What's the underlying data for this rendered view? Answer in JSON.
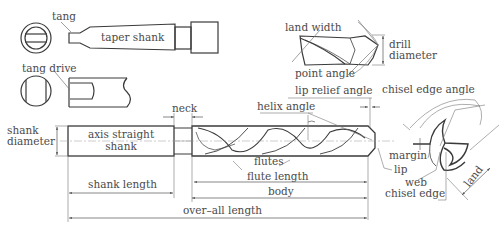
{
  "diagram": {
    "colors": {
      "line": "#3a3a3a",
      "text": "#4a4a4a",
      "thin": "#7a7a7a",
      "background": "#ffffff"
    },
    "views": {
      "taper_shank_view": {
        "labels": {
          "tang": "tang",
          "taper_shank": "taper shank"
        }
      },
      "tang_drive_view": {
        "labels": {
          "tang_drive": "tang drive"
        }
      },
      "point_detail_view": {
        "labels": {
          "land_width": "land width",
          "drill_diameter_line1": "drill",
          "drill_diameter_line2": "diameter",
          "point_angle": "point angle"
        }
      },
      "main_side_view": {
        "labels": {
          "shank_diameter_line1": "shank",
          "shank_diameter_line2": "diameter",
          "axis_straight_line1": "axis straight",
          "axis_straight_line2": "shank",
          "neck": "neck",
          "helix_angle": "helix angle",
          "lip_relief_angle": "lip relief angle",
          "flutes": "flutes",
          "flute_length": "flute length",
          "body": "body",
          "shank_length": "shank length",
          "overall_length": "over–all length"
        }
      },
      "end_view": {
        "labels": {
          "chisel_edge_angle": "chisel edge angle",
          "margin": "margin",
          "lip": "lip",
          "web": "web",
          "chisel_edge": "chisel edge",
          "land": "land"
        }
      }
    }
  }
}
